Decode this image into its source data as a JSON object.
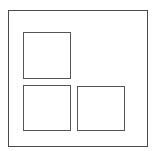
{
  "diagram": {
    "outer_frame": {
      "x": 8,
      "y": 10,
      "w": 140,
      "h": 137,
      "border_color": "#4a4a4a"
    },
    "boxes": [
      {
        "name": "top-left-square",
        "x": 23,
        "y": 32,
        "w": 48,
        "h": 47
      },
      {
        "name": "bottom-left-square",
        "x": 23,
        "y": 85,
        "w": 48,
        "h": 46
      },
      {
        "name": "bottom-right-square",
        "x": 77,
        "y": 86,
        "w": 48,
        "h": 45
      }
    ],
    "box_border_color": "#555555"
  }
}
